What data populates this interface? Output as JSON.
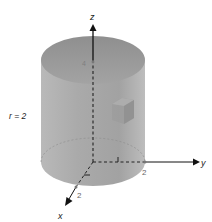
{
  "figure": {
    "type": "3d-cylinder-diagram",
    "labels": {
      "z_axis": "z",
      "y_axis": "y",
      "x_axis": "x",
      "radius": "r = 2",
      "height_mark": "4",
      "y_tick": "2",
      "x_tick": "2"
    },
    "cylinder": {
      "radius": 2,
      "height": 4
    },
    "colors": {
      "cylinder_side": "#a9a9a9",
      "cylinder_top": "#9a9a9a",
      "axis": "#111111",
      "tick_label": "#666666",
      "background": "#ffffff"
    }
  }
}
